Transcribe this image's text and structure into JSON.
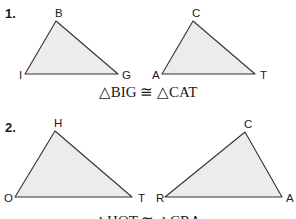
{
  "problems": [
    {
      "number": "1.",
      "triangles": [
        {
          "name": "BIG",
          "vertices": [
            {
              "label": "B",
              "x": 56,
              "y": 21,
              "lx": 55,
              "ly": 17
            },
            {
              "label": "I",
              "x": 25,
              "y": 74,
              "lx": 19,
              "ly": 79
            },
            {
              "label": "G",
              "x": 118,
              "y": 74,
              "lx": 122,
              "ly": 79
            }
          ]
        },
        {
          "name": "CAT",
          "vertices": [
            {
              "label": "C",
              "x": 193,
              "y": 21,
              "lx": 192,
              "ly": 17
            },
            {
              "label": "A",
              "x": 162,
              "y": 74,
              "lx": 152,
              "ly": 79
            },
            {
              "label": "T",
              "x": 255,
              "y": 74,
              "lx": 260,
              "ly": 79
            }
          ]
        }
      ],
      "caption": "△BIG ≅ △CAT"
    },
    {
      "number": "2.",
      "triangles": [
        {
          "name": "HOT",
          "vertices": [
            {
              "label": "H",
              "x": 55,
              "y": 131,
              "lx": 54,
              "ly": 127
            },
            {
              "label": "O",
              "x": 15,
              "y": 197,
              "lx": 4,
              "ly": 202
            },
            {
              "label": "T",
              "x": 132,
              "y": 197,
              "lx": 138,
              "ly": 202
            }
          ]
        },
        {
          "name": "CRA",
          "vertices": [
            {
              "label": "C",
              "x": 245,
              "y": 132,
              "lx": 244,
              "ly": 128
            },
            {
              "label": "R",
              "x": 165,
              "y": 197,
              "lx": 156,
              "ly": 202
            },
            {
              "label": "A",
              "x": 282,
              "y": 197,
              "lx": 286,
              "ly": 202
            }
          ]
        }
      ],
      "caption": "△HOT ≅ △CRA"
    }
  ],
  "colors": {
    "fill": "#ececec",
    "stroke": "#333333",
    "text": "#1a1a1a"
  }
}
